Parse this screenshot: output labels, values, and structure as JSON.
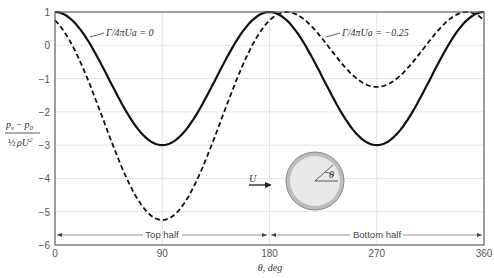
{
  "chart_data": {
    "type": "line",
    "title": "",
    "xlabel": "θ, deg",
    "ylabel": "(p_s − p_0) / (½ ρ U²)",
    "xlim": [
      0,
      360
    ],
    "ylim": [
      -6,
      1
    ],
    "xticks": [
      0,
      90,
      180,
      270,
      360
    ],
    "yticks": [
      1,
      0,
      -1,
      -2,
      -3,
      -4,
      -5,
      -6
    ],
    "grid": true,
    "series": [
      {
        "name": "Γ/4πUa = 0",
        "style": "solid",
        "formula": "1 - 4 sin^2(θ)",
        "x": [
          0,
          30,
          60,
          90,
          120,
          150,
          180,
          210,
          240,
          270,
          300,
          330,
          360
        ],
        "values": [
          1,
          0,
          -2,
          -3,
          -2,
          0,
          1,
          0,
          -2,
          -3,
          -2,
          0,
          1
        ]
      },
      {
        "name": "Γ/4πUa = -0.25",
        "style": "dashed",
        "formula": "1 - (2 sin θ + 0.5)^2",
        "x": [
          0,
          30,
          60,
          90,
          120,
          150,
          180,
          210,
          240,
          270,
          300,
          330,
          360
        ],
        "values": [
          0.75,
          -1.25,
          -4.71,
          -5.25,
          -4.71,
          -1.25,
          0.75,
          1,
          0.89,
          -1.25,
          -0.89,
          1,
          0.75
        ]
      }
    ],
    "annotations": [
      "Γ/4πUa = 0",
      "Γ/4πUa = −0.25",
      "Top half",
      "Bottom half",
      "U",
      "θ"
    ]
  },
  "labels": {
    "series0": "Γ/4πUa = 0",
    "series1": "Γ/4πUa = −0.25",
    "top_half": "Top half",
    "bottom_half": "Bottom half",
    "xlabel": "θ, deg",
    "ylabel_num": "p",
    "ylabel_den": "ρU",
    "flow": "U",
    "angle": "θ"
  }
}
